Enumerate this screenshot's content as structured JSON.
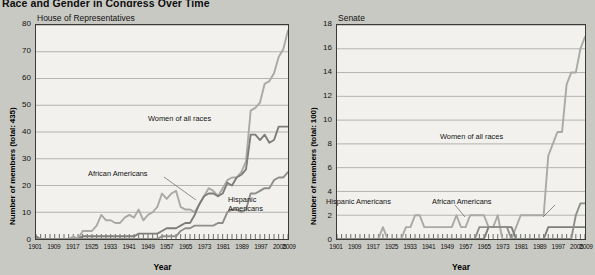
{
  "title": "Race and Gender in Congress Over Time",
  "axis": {
    "x_title": "Year",
    "x_ticks": [
      "1901",
      "1909",
      "1917",
      "1925",
      "1933",
      "1941",
      "1949",
      "1957",
      "1965",
      "1973",
      "1981",
      "1989",
      "1997",
      "2005",
      "2009"
    ]
  },
  "panels": {
    "house": {
      "caption": "House of Representatives",
      "y_title": "Number of members (total: 435)",
      "y_ticks": [
        "0",
        "10",
        "20",
        "30",
        "40",
        "50",
        "60",
        "70",
        "80"
      ],
      "labels": {
        "women": "Women of all races",
        "african": "African Americans",
        "hispanic_line1": "Hispanic",
        "hispanic_line2": "Americans"
      }
    },
    "senate": {
      "caption": "Senate",
      "y_title": "Number of members (total: 100)",
      "y_ticks": [
        "0",
        "2",
        "4",
        "6",
        "8",
        "10",
        "12",
        "14",
        "16",
        "18"
      ],
      "labels": {
        "women": "Women of all races",
        "african": "African Americans",
        "hispanic": "Hispanic Americans"
      }
    }
  },
  "colors": {
    "women": "#a9a9a6",
    "african": "#7d7d79",
    "hispanic": "#8e8e8a",
    "plot_background": "#f2f1ee",
    "page_background": "#c9c9c4",
    "gridline": "#9a9a96",
    "axis": "#3a3a38"
  },
  "chart_data": [
    {
      "type": "line",
      "title": "House of Representatives",
      "xlabel": "Year",
      "ylabel": "Number of members (total: 435)",
      "xlim": [
        1901,
        2009
      ],
      "ylim": [
        0,
        80
      ],
      "grid": true,
      "legend": "inline-annotations",
      "x": [
        1901,
        1903,
        1905,
        1907,
        1909,
        1911,
        1913,
        1915,
        1917,
        1919,
        1921,
        1923,
        1925,
        1927,
        1929,
        1931,
        1933,
        1935,
        1937,
        1939,
        1941,
        1943,
        1945,
        1947,
        1949,
        1951,
        1953,
        1955,
        1957,
        1959,
        1961,
        1963,
        1965,
        1967,
        1969,
        1971,
        1973,
        1975,
        1977,
        1979,
        1981,
        1983,
        1985,
        1987,
        1989,
        1991,
        1993,
        1995,
        1997,
        1999,
        2001,
        2003,
        2005,
        2007,
        2009
      ],
      "series": [
        {
          "name": "Women of all races",
          "values": [
            0,
            0,
            0,
            0,
            0,
            0,
            0,
            0,
            1,
            0,
            3,
            3,
            3,
            5,
            9,
            7,
            7,
            6,
            6,
            8,
            9,
            8,
            11,
            7,
            9,
            10,
            12,
            17,
            15,
            17,
            18,
            12,
            11,
            11,
            10,
            13,
            16,
            19,
            18,
            16,
            19,
            22,
            23,
            23,
            25,
            29,
            48,
            49,
            51,
            58,
            59,
            62,
            68,
            71,
            78
          ]
        },
        {
          "name": "African Americans",
          "values": [
            1,
            0,
            0,
            0,
            0,
            0,
            0,
            0,
            0,
            0,
            1,
            1,
            1,
            1,
            1,
            1,
            1,
            1,
            1,
            1,
            1,
            1,
            2,
            2,
            2,
            2,
            2,
            3,
            4,
            4,
            4,
            5,
            6,
            6,
            9,
            13,
            16,
            17,
            17,
            16,
            17,
            21,
            20,
            23,
            24,
            26,
            39,
            39,
            37,
            39,
            36,
            37,
            42,
            42,
            42
          ]
        },
        {
          "name": "Hispanic Americans",
          "values": [
            0,
            0,
            0,
            0,
            0,
            0,
            0,
            0,
            0,
            0,
            0,
            0,
            0,
            0,
            0,
            0,
            0,
            0,
            0,
            0,
            0,
            0,
            0,
            0,
            0,
            0,
            0,
            1,
            1,
            1,
            1,
            3,
            4,
            4,
            5,
            5,
            5,
            5,
            5,
            6,
            6,
            10,
            11,
            11,
            10,
            11,
            17,
            17,
            18,
            19,
            19,
            22,
            23,
            23,
            25
          ]
        }
      ]
    },
    {
      "type": "line",
      "title": "Senate",
      "xlabel": "Year",
      "ylabel": "Number of members (total: 100)",
      "xlim": [
        1901,
        2009
      ],
      "ylim": [
        0,
        18
      ],
      "grid": true,
      "legend": "inline-annotations",
      "x": [
        1901,
        1903,
        1905,
        1907,
        1909,
        1911,
        1913,
        1915,
        1917,
        1919,
        1921,
        1923,
        1925,
        1927,
        1929,
        1931,
        1933,
        1935,
        1937,
        1939,
        1941,
        1943,
        1945,
        1947,
        1949,
        1951,
        1953,
        1955,
        1957,
        1959,
        1961,
        1963,
        1965,
        1967,
        1969,
        1971,
        1973,
        1975,
        1977,
        1979,
        1981,
        1983,
        1985,
        1987,
        1989,
        1991,
        1993,
        1995,
        1997,
        1999,
        2001,
        2003,
        2005,
        2007,
        2009
      ],
      "series": [
        {
          "name": "Women of all races",
          "values": [
            0,
            0,
            0,
            0,
            0,
            0,
            0,
            0,
            0,
            0,
            1,
            0,
            0,
            0,
            0,
            1,
            1,
            2,
            2,
            1,
            1,
            1,
            1,
            1,
            1,
            1,
            2,
            1,
            1,
            2,
            2,
            2,
            2,
            1,
            1,
            2,
            0,
            0,
            0,
            1,
            2,
            2,
            2,
            2,
            2,
            2,
            7,
            8,
            9,
            9,
            13,
            14,
            14,
            16,
            17
          ]
        },
        {
          "name": "African Americans",
          "values": [
            0,
            0,
            0,
            0,
            0,
            0,
            0,
            0,
            0,
            0,
            0,
            0,
            0,
            0,
            0,
            0,
            0,
            0,
            0,
            0,
            0,
            0,
            0,
            0,
            0,
            0,
            0,
            0,
            0,
            0,
            0,
            0,
            0,
            1,
            1,
            1,
            1,
            1,
            1,
            0,
            0,
            0,
            0,
            0,
            0,
            0,
            1,
            1,
            1,
            1,
            1,
            1,
            1,
            1,
            1
          ]
        },
        {
          "name": "Hispanic Americans",
          "values": [
            0,
            0,
            0,
            0,
            0,
            0,
            0,
            0,
            0,
            0,
            0,
            0,
            0,
            0,
            0,
            0,
            0,
            0,
            0,
            0,
            0,
            0,
            0,
            0,
            0,
            0,
            0,
            0,
            0,
            0,
            0,
            1,
            1,
            1,
            1,
            1,
            1,
            1,
            0,
            0,
            0,
            0,
            0,
            0,
            0,
            0,
            0,
            0,
            0,
            0,
            0,
            0,
            2,
            3,
            3
          ]
        }
      ]
    }
  ]
}
